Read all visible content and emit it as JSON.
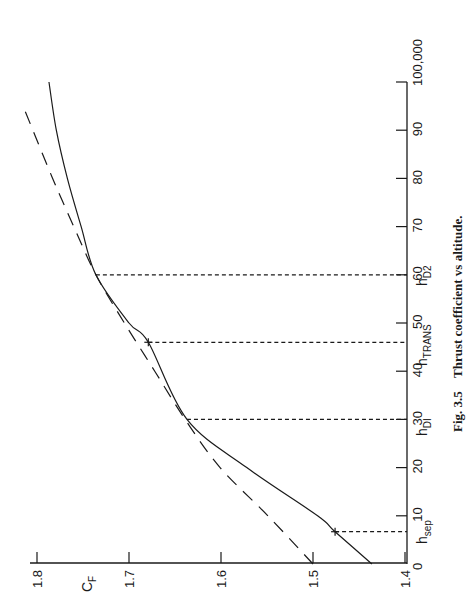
{
  "figure": {
    "caption_number": "Fig. 3.5",
    "caption_text": "Thrust coefficient vs altitude.",
    "orientation": "rotated 90 degrees counter-clockwise"
  },
  "axes": {
    "x_ticks": [
      "0",
      "10",
      "20",
      "30",
      "40",
      "50",
      "60",
      "70",
      "80",
      "90",
      "100,000"
    ],
    "y_ticks": [
      "1.4",
      "1.5",
      "1.6",
      "1.7",
      "1.8"
    ],
    "y_label_main": "C",
    "y_label_sub": "F"
  },
  "markers": {
    "sep": {
      "main": "h",
      "sub": "sep"
    },
    "d1": {
      "main": "h",
      "sub": "DI"
    },
    "trans": {
      "main": "h",
      "sub": "TRANS"
    },
    "d2": {
      "main": "h",
      "sub": "D2"
    }
  },
  "chart_data": {
    "type": "line",
    "title": "Thrust coefficient vs altitude",
    "caption": "Fig. 3.5 Thrust coefficient vs altitude.",
    "xlabel": "Altitude (ft)",
    "ylabel": "C_F",
    "xlim": [
      0,
      100000
    ],
    "ylim": [
      1.4,
      1.8
    ],
    "x_tick_labels": [
      "0",
      "10",
      "20",
      "30",
      "40",
      "50",
      "60",
      "70",
      "80",
      "90",
      "100,000"
    ],
    "y_tick_labels": [
      "1.4",
      "1.5",
      "1.6",
      "1.7",
      "1.8"
    ],
    "grid": false,
    "series": [
      {
        "name": "Actual thrust coefficient (solid)",
        "style": "solid",
        "x": [
          0,
          6700,
          10000,
          20000,
          30000,
          46000,
          50000,
          60000,
          70000,
          80000,
          90000,
          100000
        ],
        "values": [
          1.436,
          1.476,
          1.495,
          1.572,
          1.637,
          1.679,
          1.7,
          1.736,
          1.752,
          1.767,
          1.779,
          1.787
        ]
      },
      {
        "name": "Ideal (optimum-expansion) thrust coefficient (dashed)",
        "style": "dashed",
        "x": [
          0,
          10000,
          20000,
          30000,
          40000,
          50000,
          60000,
          70000,
          80000,
          94000
        ],
        "values": [
          1.5,
          1.549,
          1.601,
          1.639,
          1.672,
          1.705,
          1.736,
          1.76,
          1.783,
          1.813
        ]
      }
    ],
    "annotations": [
      {
        "label": "h_sep",
        "x": 6700,
        "y": 1.476,
        "marker": "+",
        "guide": "dashed vertical to x-axis"
      },
      {
        "label": "h_D1",
        "x": 30000,
        "y": 1.637,
        "marker": "none",
        "guide": "dashed vertical to x-axis"
      },
      {
        "label": "h_TRANS",
        "x": 46000,
        "y": 1.679,
        "marker": "+",
        "guide": "dashed vertical to x-axis"
      },
      {
        "label": "h_D2",
        "x": 60000,
        "y": 1.736,
        "marker": "none",
        "guide": "dashed vertical to x-axis"
      }
    ]
  }
}
